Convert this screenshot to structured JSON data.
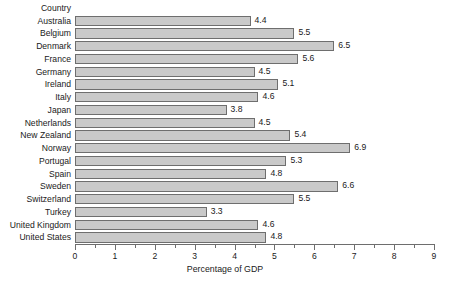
{
  "chart_data": {
    "type": "bar",
    "orientation": "horizontal",
    "title": "",
    "xlabel": "Percentage of GDP",
    "ylabel": "Country",
    "xlim": [
      0,
      9
    ],
    "xticks": [
      0,
      1,
      2,
      3,
      4,
      5,
      6,
      7,
      8,
      9
    ],
    "xtick_labels": [
      "0",
      "1",
      "2",
      "3",
      "4",
      "5",
      "6",
      "7",
      "8",
      "9"
    ],
    "minor_tick_step": 0.5,
    "grid": false,
    "legend": "none",
    "data_labels": true,
    "bar_color": "#c9c9c9",
    "bar_edge_color": "#6e6e6e",
    "categories": [
      "Australia",
      "Belgium",
      "Denmark",
      "France",
      "Germany",
      "Ireland",
      "Italy",
      "Japan",
      "Netherlands",
      "New Zealand",
      "Norway",
      "Portugal",
      "Spain",
      "Sweden",
      "Switzerland",
      "Turkey",
      "United Kingdom",
      "United States"
    ],
    "values": [
      4.4,
      5.5,
      6.5,
      5.6,
      4.5,
      5.1,
      4.6,
      3.8,
      4.5,
      5.4,
      6.9,
      5.3,
      4.8,
      6.6,
      5.5,
      3.3,
      4.6,
      4.8
    ],
    "value_labels": [
      "4.4",
      "5.5",
      "6.5",
      "5.6",
      "4.5",
      "5.1",
      "4.6",
      "3.8",
      "4.5",
      "5.4",
      "6.9",
      "5.3",
      "4.8",
      "6.6",
      "5.5",
      "3.3",
      "4.6",
      "4.8"
    ]
  }
}
